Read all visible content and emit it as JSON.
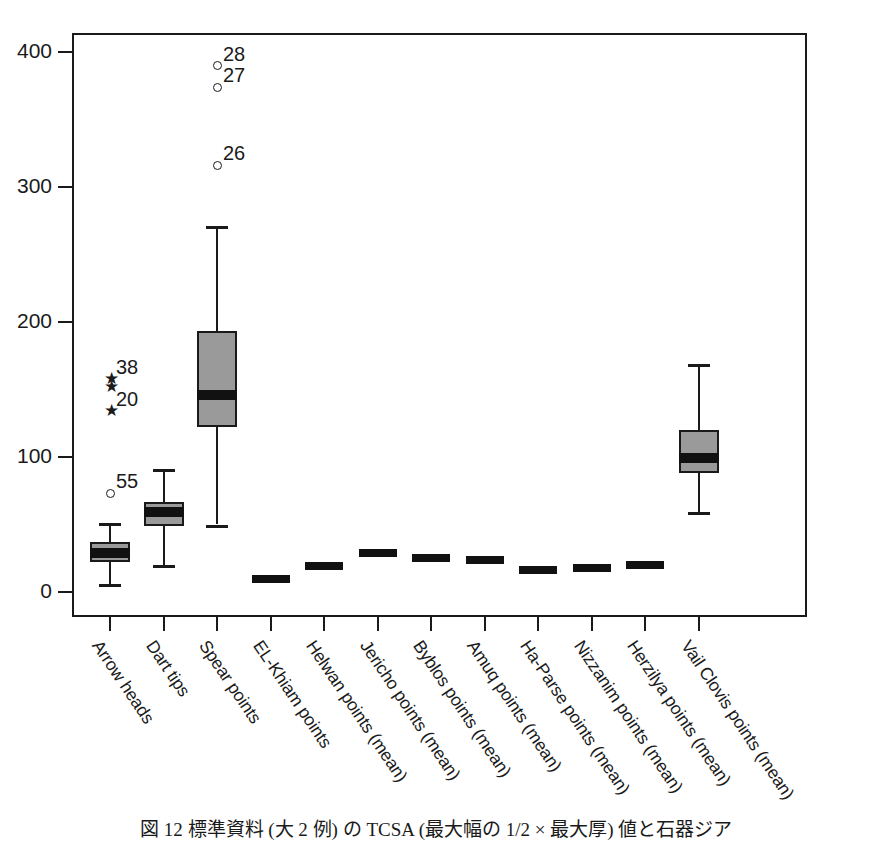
{
  "chart_data": {
    "type": "box",
    "title": "",
    "xlabel": "",
    "ylabel": "",
    "ylim": [
      -25,
      425
    ],
    "yticks": [
      0,
      100,
      200,
      300,
      400
    ],
    "ytick_labels": [
      "0",
      "100",
      "200",
      "300",
      "400"
    ],
    "grid": false,
    "legend": "none",
    "categories": [
      "Arrow heads",
      "Dart tips",
      "Spear points",
      "EL-Khiam points",
      "Helwan points (mean)",
      "Jericho points (mean)",
      "Byblos points (mean)",
      "Amuq points (mean)",
      "Ha-Parse points (mean)",
      "Nizzanim points (mean)",
      "Herzilya points (mean)",
      "Vail Clovis points (mean)"
    ],
    "boxes": [
      {
        "category": "Arrow heads",
        "kind": "box",
        "whisker_low": 6,
        "q1": 22,
        "median": 29,
        "q3": 37,
        "whisker_high": 51,
        "outliers": [
          {
            "value": 73,
            "marker": "circle",
            "label": "55"
          },
          {
            "value": 134,
            "marker": "star",
            "label": "20"
          },
          {
            "value": 152,
            "marker": "star",
            "label": ""
          },
          {
            "value": 158,
            "marker": "star",
            "label": "38"
          }
        ]
      },
      {
        "category": "Dart tips",
        "kind": "box",
        "whisker_low": 20,
        "q1": 49,
        "median": 59,
        "q3": 67,
        "whisker_high": 91,
        "outliers": []
      },
      {
        "category": "Spear points",
        "kind": "box",
        "whisker_low": 50,
        "q1": 122,
        "median": 146,
        "q3": 193,
        "whisker_high": 271,
        "outliers": [
          {
            "value": 316,
            "marker": "circle",
            "label": "26"
          },
          {
            "value": 374,
            "marker": "circle",
            "label": "27"
          },
          {
            "value": 390,
            "marker": "circle",
            "label": "28"
          }
        ]
      },
      {
        "category": "EL-Khiam points",
        "kind": "mean",
        "value": 10
      },
      {
        "category": "Helwan points (mean)",
        "kind": "mean",
        "value": 19
      },
      {
        "category": "Jericho points (mean)",
        "kind": "mean",
        "value": 29
      },
      {
        "category": "Byblos points (mean)",
        "kind": "mean",
        "value": 25
      },
      {
        "category": "Amuq points (mean)",
        "kind": "mean",
        "value": 24
      },
      {
        "category": "Ha-Parse points (mean)",
        "kind": "mean",
        "value": 16
      },
      {
        "category": "Nizzanim points (mean)",
        "kind": "mean",
        "value": 18
      },
      {
        "category": "Herzilya points (mean)",
        "kind": "mean",
        "value": 20
      },
      {
        "category": "Vail Clovis points (mean)",
        "kind": "box",
        "whisker_low": 59,
        "q1": 88,
        "median": 99,
        "q3": 120,
        "whisker_high": 169,
        "outliers": []
      }
    ],
    "colors": {
      "box_fill": "#9a9a9a",
      "line": "#1a1a1a",
      "median": "#111111",
      "background": "#ffffff"
    }
  },
  "caption": {
    "text": "図 12 標準資料 (大 2 例) の TCSA (最大幅の 1/2 × 最大厚) 値と石器ジア"
  }
}
